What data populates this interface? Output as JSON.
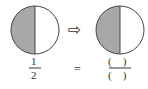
{
  "left_circle": {
    "shaded_half": "left",
    "fill": "#a8a8a8"
  },
  "right_circle": {
    "shaded_half": "left",
    "fill": "#a8a8a8"
  },
  "arrow": {
    "symbol": "⇨"
  },
  "left_fraction": {
    "numerator": "1",
    "denominator": "2"
  },
  "equals": "=",
  "right_fraction": {
    "numerator": "(　)",
    "denominator": "(　)"
  }
}
